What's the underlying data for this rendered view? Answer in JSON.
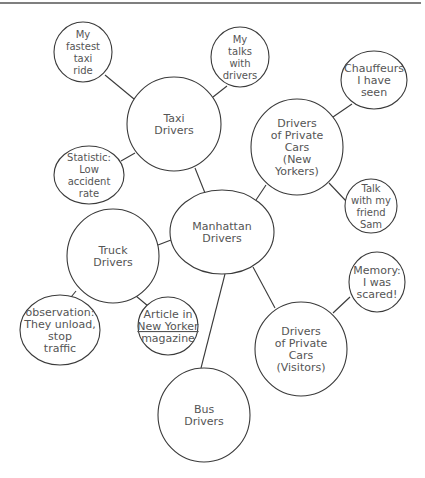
{
  "diagram": {
    "type": "cluster-map",
    "top_rule": {
      "x1": 0,
      "y1": 3,
      "x2": 421,
      "y2": 3
    },
    "colors": {
      "stroke": "#3a3a3a",
      "text": "#555555",
      "background": "#ffffff"
    },
    "nodes": [
      {
        "id": "manhattan",
        "shape": "ellipse",
        "cx": 222,
        "cy": 232,
        "rx": 52,
        "ry": 42,
        "lines": [
          "Manhattan",
          "Drivers"
        ]
      },
      {
        "id": "taxi",
        "shape": "ellipse",
        "cx": 174,
        "cy": 124,
        "rx": 47,
        "ry": 47,
        "lines": [
          "Taxi",
          "Drivers"
        ]
      },
      {
        "id": "fastest-ride",
        "shape": "ellipse",
        "cx": 83,
        "cy": 52,
        "rx": 29,
        "ry": 30,
        "lines": [
          "My",
          "fastest",
          "taxi",
          "ride"
        ]
      },
      {
        "id": "talks",
        "shape": "ellipse",
        "cx": 240,
        "cy": 57,
        "rx": 29,
        "ry": 30,
        "lines": [
          "My",
          "talks",
          "with",
          "drivers"
        ]
      },
      {
        "id": "statistic",
        "shape": "ellipse",
        "cx": 89,
        "cy": 175,
        "rx": 35,
        "ry": 29,
        "lines": [
          "Statistic:",
          "Low",
          "accident",
          "rate"
        ]
      },
      {
        "id": "private-ny",
        "shape": "ellipse",
        "cx": 297,
        "cy": 147,
        "rx": 46,
        "ry": 48,
        "lines": [
          "Drivers",
          "of Private",
          "Cars",
          "(New",
          "Yorkers)"
        ]
      },
      {
        "id": "chauffeurs",
        "shape": "ellipse",
        "cx": 374,
        "cy": 80,
        "rx": 33,
        "ry": 29,
        "lines": [
          "Chauffeurs",
          "I have",
          "seen"
        ]
      },
      {
        "id": "sam",
        "shape": "ellipse",
        "cx": 371,
        "cy": 206,
        "rx": 26,
        "ry": 27,
        "lines": [
          "Talk",
          "with my",
          "friend",
          "Sam"
        ]
      },
      {
        "id": "truck",
        "shape": "ellipse",
        "cx": 113,
        "cy": 256,
        "rx": 46,
        "ry": 47,
        "lines": [
          "Truck",
          "Drivers"
        ]
      },
      {
        "id": "observation",
        "shape": "ellipse",
        "cx": 60,
        "cy": 330,
        "rx": 40,
        "ry": 35,
        "lines": [
          "observation:",
          "They unload,",
          "stop",
          "traffic"
        ]
      },
      {
        "id": "article",
        "shape": "ellipse",
        "cx": 168,
        "cy": 326,
        "rx": 30,
        "ry": 29,
        "lines": [
          "Article in",
          "New Yorker",
          "magazine"
        ],
        "underlined_line": 1
      },
      {
        "id": "private-visitors",
        "shape": "ellipse",
        "cx": 301,
        "cy": 349,
        "rx": 46,
        "ry": 47,
        "lines": [
          "Drivers",
          "of Private",
          "Cars",
          "(Visitors)"
        ]
      },
      {
        "id": "memory",
        "shape": "ellipse",
        "cx": 377,
        "cy": 282,
        "rx": 28,
        "ry": 30,
        "lines": [
          "Memory:",
          "I was",
          "scared!"
        ]
      },
      {
        "id": "bus",
        "shape": "ellipse",
        "cx": 204,
        "cy": 415,
        "rx": 46,
        "ry": 47,
        "lines": [
          "Bus",
          "Drivers"
        ]
      }
    ],
    "edges": [
      {
        "from": "fastest-ride",
        "to": "taxi",
        "x1": 105,
        "y1": 75,
        "x2": 134,
        "y2": 99
      },
      {
        "from": "talks",
        "to": "taxi",
        "x1": 227,
        "y1": 86,
        "x2": 213,
        "y2": 97
      },
      {
        "from": "statistic",
        "to": "taxi",
        "x1": 121,
        "y1": 161,
        "x2": 135,
        "y2": 153
      },
      {
        "from": "taxi",
        "to": "manhattan",
        "x1": 195,
        "y1": 168,
        "x2": 205,
        "y2": 193
      },
      {
        "from": "chauffeurs",
        "to": "private-ny",
        "x1": 352,
        "y1": 104,
        "x2": 333,
        "y2": 117
      },
      {
        "from": "private-ny",
        "to": "sam",
        "x1": 329,
        "y1": 183,
        "x2": 346,
        "y2": 201
      },
      {
        "from": "private-ny",
        "to": "manhattan",
        "x1": 266,
        "y1": 185,
        "x2": 256,
        "y2": 200
      },
      {
        "from": "truck",
        "to": "manhattan",
        "x1": 158,
        "y1": 245,
        "x2": 171,
        "y2": 240
      },
      {
        "from": "truck",
        "to": "observation",
        "x1": 76,
        "y1": 291,
        "x2": 67,
        "y2": 302
      },
      {
        "from": "truck",
        "to": "article",
        "x1": 136,
        "y1": 296,
        "x2": 148,
        "y2": 306
      },
      {
        "from": "manhattan",
        "to": "private-visitors",
        "x1": 253,
        "y1": 267,
        "x2": 275,
        "y2": 308
      },
      {
        "from": "manhattan",
        "to": "bus",
        "x1": 225,
        "y1": 274,
        "x2": 201,
        "y2": 368
      },
      {
        "from": "memory",
        "to": "private-visitors",
        "x1": 350,
        "y1": 297,
        "x2": 333,
        "y2": 313
      }
    ]
  }
}
